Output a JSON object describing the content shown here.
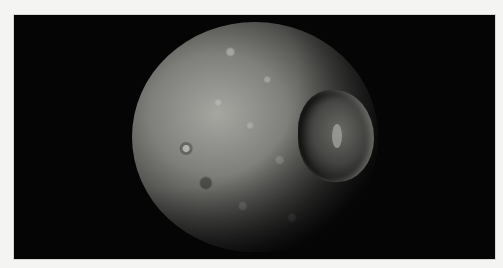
{
  "image": {
    "subject": "Saturn's moon Mimas",
    "description": "Cratered grey moon on black background with large Herschel crater on the right side",
    "background_color": "#050505",
    "page_color": "#f4f4f2",
    "surface_color": "#8c8c88"
  },
  "features": [
    {
      "name": "moon-body",
      "label": "Mimas"
    },
    {
      "name": "large-crater",
      "label": "Herschel crater"
    }
  ]
}
